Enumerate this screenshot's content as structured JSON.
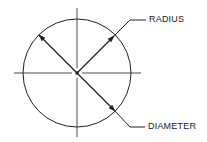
{
  "diagram": {
    "type": "circle-geometry",
    "stroke_color": "#222222",
    "background": "#ffffff",
    "circle": {
      "cx": 77,
      "cy": 73,
      "r": 54
    },
    "centerlines": {
      "horizontal": {
        "x1": 14,
        "x2": 141,
        "y": 73
      },
      "vertical": {
        "x": 77,
        "y1": 8,
        "y2": 137
      }
    },
    "labels": {
      "radius": "RADIUS",
      "diameter": "DIAMETER"
    }
  }
}
